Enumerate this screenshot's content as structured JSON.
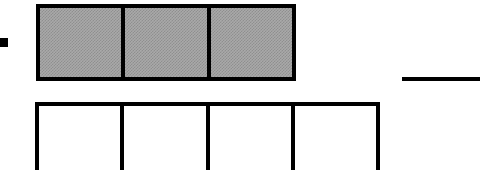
{
  "figure": {
    "kind": "fraction-tape-diagram",
    "canvas": {
      "width": 501,
      "height": 170,
      "background": "#ffffff"
    },
    "ink_color": "#000000",
    "shade_color": "#a9a9a9",
    "bullet": {
      "label": "",
      "shape": "filled-square",
      "x": 0,
      "y": 38,
      "width": 8,
      "height": 9,
      "color": "#000000"
    },
    "top_bar": {
      "name": "shaded-bar",
      "partitions": 3,
      "shaded_count": 3,
      "fraction": "3/3",
      "x": 36,
      "y": 4,
      "width": 260,
      "height": 77,
      "border_width": 4,
      "fill": "#a9a9a9",
      "cells": [
        {
          "index": 1,
          "label": "",
          "shaded": true
        },
        {
          "index": 2,
          "label": "",
          "shaded": true
        },
        {
          "index": 3,
          "label": "",
          "shaded": true
        }
      ]
    },
    "bottom_bar": {
      "name": "blank-bar",
      "partitions": 4,
      "shaded_count": 0,
      "fraction": "0/4",
      "x": 35,
      "y": 102,
      "width": 345,
      "height": 72,
      "border_width": 4,
      "fill": "#ffffff",
      "clipped_at_bottom": true,
      "cells": [
        {
          "index": 1,
          "label": "",
          "shaded": false
        },
        {
          "index": 2,
          "label": "",
          "shaded": false
        },
        {
          "index": 3,
          "label": "",
          "shaded": false
        },
        {
          "index": 4,
          "label": "",
          "shaded": false
        }
      ]
    },
    "answer_dash": {
      "name": "answer-blank-rule",
      "label": "",
      "x": 402,
      "y": 77,
      "width": 78,
      "height": 4,
      "color": "#000000"
    }
  }
}
